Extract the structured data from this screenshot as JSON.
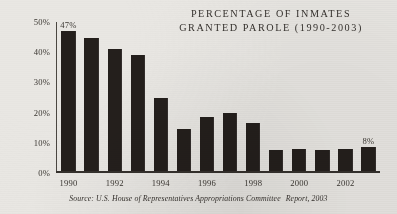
{
  "chart_data": {
    "type": "bar",
    "title": "PERCENTAGE OF INMATES GRANTED PAROLE (1990-2003)",
    "title_lines": [
      "PERCENTAGE OF INMATES",
      "GRANTED PAROLE (1990-2003)"
    ],
    "xlabel": "",
    "ylabel": "",
    "ylim": [
      0,
      50
    ],
    "grid": false,
    "legend": false,
    "categories": [
      "1990",
      "1991",
      "1992",
      "1993",
      "1994",
      "1995",
      "1996",
      "1997",
      "1998",
      "1999",
      "2000",
      "2001",
      "2002",
      "2003"
    ],
    "values": [
      47,
      44.5,
      41,
      39,
      24.5,
      14,
      18,
      19.5,
      16,
      7,
      7.5,
      7,
      7.5,
      8
    ],
    "y_ticks": [
      "0%",
      "10%",
      "20%",
      "30%",
      "40%",
      "50%"
    ],
    "y_tick_values": [
      0,
      10,
      20,
      30,
      40,
      50
    ],
    "x_tick_labels": [
      "1990",
      "",
      "1992",
      "",
      "1994",
      "",
      "1996",
      "",
      "1998",
      "",
      "2000",
      "",
      "2002",
      ""
    ],
    "point_labels": [
      {
        "index": 0,
        "text": "47%"
      },
      {
        "index": 13,
        "text": "8%"
      }
    ],
    "bar_color": "#241f1c",
    "background_color": "#e9e7e3",
    "axis_color": "#35312d",
    "text_color": "#35312d"
  },
  "source": {
    "prefix": "Source: U.S. House of Representatives Appropriations Committee",
    "suffix": "Report, 2003"
  }
}
